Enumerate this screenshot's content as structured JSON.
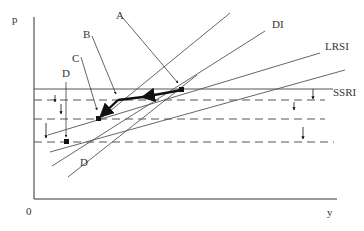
{
  "diagram": {
    "axes": {
      "y_label": "p",
      "x_label": "y",
      "origin_label": "0"
    },
    "curves": {
      "di": "DI",
      "lrsi": "LRSI",
      "ssri": "SSRI",
      "d": "D"
    },
    "points": {
      "a": "A",
      "b": "B",
      "c": "C",
      "d": "D"
    },
    "colors": {
      "line": "#555555",
      "axis": "#333333",
      "path": "#111111"
    }
  }
}
